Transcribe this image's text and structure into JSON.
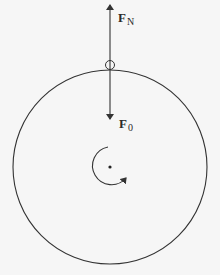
{
  "diagram": {
    "title": "",
    "forces": [
      {
        "id": "normal",
        "symbol": "F",
        "subscript": "N",
        "direction": "up"
      },
      {
        "id": "applied",
        "symbol": "F",
        "subscript": "0",
        "direction": "down"
      }
    ],
    "labels": {
      "fn_main": "F",
      "fn_sub": "N",
      "f0_main": "F",
      "f0_sub": "0"
    },
    "elements": {
      "disk": {
        "cx": 110,
        "cy": 167,
        "r": 97
      },
      "contact_point": {
        "cx": 110,
        "cy": 65,
        "r": 4
      },
      "center_point": {
        "cx": 110,
        "cy": 167
      },
      "rotation": "counterclockwise"
    },
    "colors": {
      "background": "#f6f6f6",
      "stroke": "#333333"
    }
  }
}
